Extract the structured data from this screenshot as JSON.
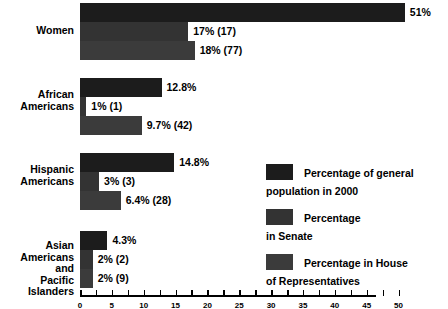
{
  "chart_data": {
    "type": "bar",
    "orientation": "horizontal",
    "title": "",
    "xlabel": "",
    "ylabel": "",
    "grid": false,
    "legend_position": "right",
    "xlim": [
      0,
      55
    ],
    "categories": [
      "Women",
      "African\nAmericans",
      "Hispanic\nAmericans",
      "Asian\nAmericans and\nPacific Islanders"
    ],
    "series": [
      {
        "name": "Percentage of general\npopulation in 2000",
        "color": "#1c1c1c",
        "values": [
          51,
          12.8,
          14.8,
          4.3
        ],
        "labels": [
          "51%",
          "12.8%",
          "14.8%",
          "4.3%"
        ]
      },
      {
        "name": "Percentage\nin Senate",
        "color": "#333333",
        "values": [
          17,
          1,
          3,
          2
        ],
        "labels": [
          "17% (17)",
          "1% (1)",
          "3% (3)",
          "2% (2)"
        ]
      },
      {
        "name": "Percentage in House\nof Representatives",
        "color": "#3b3b3b",
        "values": [
          18,
          9.7,
          6.4,
          2
        ],
        "labels": [
          "18% (77)",
          "9.7% (42)",
          "6.4% (28)",
          "2% (9)"
        ]
      }
    ],
    "axis_ticks": [
      0,
      2.5,
      5,
      7.5,
      10,
      12.5,
      15,
      17.5,
      20,
      22.5,
      25,
      27.5,
      30,
      32.5,
      35,
      37.5,
      40,
      42.5,
      45,
      47.5,
      50
    ],
    "axis_tick_labels": [
      "0",
      "",
      "5",
      "",
      "10",
      "",
      "15",
      "",
      "20",
      "",
      "25",
      "",
      "30",
      "",
      "35",
      "",
      "40",
      "",
      "45",
      "",
      "50"
    ]
  },
  "legend": {
    "items": [
      {
        "label": "Percentage of general\npopulation in 2000"
      },
      {
        "label": "Percentage\nin Senate"
      },
      {
        "label": "Percentage in House\nof Representatives"
      }
    ]
  }
}
